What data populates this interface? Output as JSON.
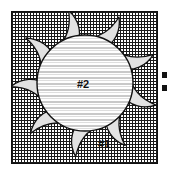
{
  "figure": {
    "name": "impeller-cross-section-figure",
    "frame": {
      "name": "substrate-frame",
      "fill_pattern": "crosshatch-grid",
      "border_color": "#111111",
      "background_color": "#ffffff",
      "hatch_color": "#1a1a1a"
    },
    "hub": {
      "name": "striped-circular-hub",
      "fill_pattern": "horizontal-stripes",
      "stripe_light_color": "#ffffff",
      "stripe_dark_color": "#c9c9c9",
      "outline_color": "#111111",
      "center_x": 74,
      "center_y": 72,
      "radius": 48
    },
    "blades": {
      "name": "curved-blade-ring",
      "count": 9,
      "fill_color": "#e2e2e2",
      "outline_color": "#111111",
      "rotation_direction": "counter-clockwise"
    },
    "labels": {
      "hub": "#2",
      "blade": "#1"
    },
    "edge_marks": {
      "name": "clipped-edge-marks",
      "count": 2,
      "color": "#111111"
    }
  }
}
